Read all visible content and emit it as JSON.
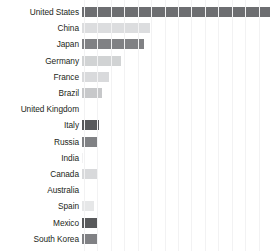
{
  "chart_data": {
    "type": "bar",
    "orientation": "horizontal",
    "title": "",
    "subtitle": "",
    "xlabel": "",
    "ylabel": "",
    "grid": true,
    "legend": "none",
    "xlim": [
      0,
      14
    ],
    "gridline_count": 14,
    "categories": [
      "United States",
      "China",
      "Japan",
      "Germany",
      "France",
      "Brazil",
      "United Kingdom",
      "Italy",
      "Russia",
      "India",
      "Canada",
      "Australia",
      "Spain",
      "Mexico",
      "South Korea"
    ],
    "values": [
      14.0,
      5.1,
      4.6,
      2.9,
      2.0,
      1.5,
      0.0,
      1.3,
      1.2,
      0.1,
      1.1,
      0.0,
      0.9,
      1.2,
      1.1
    ],
    "bar_colors": [
      "#6d6e71",
      "#dcdddf",
      "#808184",
      "#d1d3d4",
      "#d9dadc",
      "#c7c8ca",
      "#ffffff",
      "#58595b",
      "#808184",
      "#f1f1f2",
      "#d8d9db",
      "#ffffff",
      "#e6e7e8",
      "#58595b",
      "#808184"
    ],
    "axis_tick_labels": [],
    "gridline_color": "#f2f2f3",
    "background_color": "#ffffff",
    "label_color": "#231f20"
  }
}
